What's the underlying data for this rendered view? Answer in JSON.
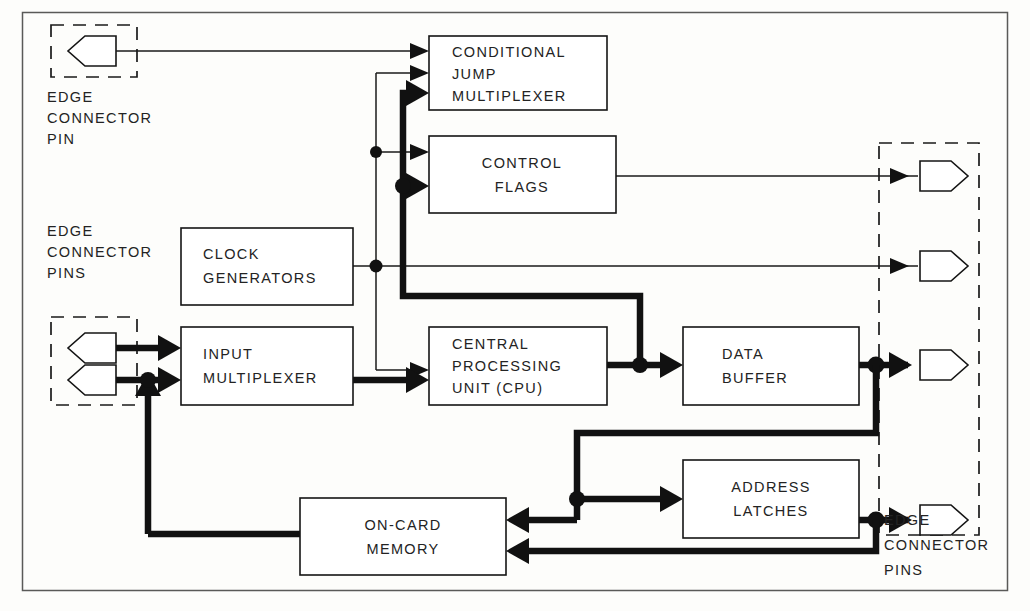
{
  "diagram": {
    "type": "block-diagram",
    "colors": {
      "line": "#111111",
      "block_border": "#141414",
      "text": "#232323",
      "frame": "#5a5a58",
      "background": "#fdfdfb"
    },
    "blocks": [
      {
        "id": "conditional-jump-multiplexer",
        "lines": [
          "CONDITIONAL",
          "JUMP",
          "MULTIPLEXER"
        ],
        "align": "left",
        "x": 429,
        "y": 36,
        "w": 178,
        "h": 74
      },
      {
        "id": "control-flags",
        "lines": [
          "CONTROL",
          "FLAGS"
        ],
        "align": "center",
        "x": 429,
        "y": 136,
        "w": 187,
        "h": 77
      },
      {
        "id": "clock-generators",
        "lines": [
          "CLOCK",
          "GENERATORS"
        ],
        "align": "left",
        "x": 181,
        "y": 228,
        "w": 172,
        "h": 77
      },
      {
        "id": "input-multiplexer",
        "lines": [
          "INPUT",
          "MULTIPLEXER"
        ],
        "align": "left",
        "x": 181,
        "y": 327,
        "w": 172,
        "h": 78
      },
      {
        "id": "central-processing-unit",
        "lines": [
          "CENTRAL",
          "PROCESSING",
          "UNIT  (CPU)"
        ],
        "align": "left",
        "x": 429,
        "y": 327,
        "w": 178,
        "h": 78
      },
      {
        "id": "data-buffer",
        "lines": [
          "DATA",
          "BUFFER"
        ],
        "align": "left",
        "x": 683,
        "y": 327,
        "w": 176,
        "h": 78
      },
      {
        "id": "address-latches",
        "lines": [
          "ADDRESS",
          "LATCHES"
        ],
        "align": "center",
        "x": 683,
        "y": 460,
        "w": 176,
        "h": 78
      },
      {
        "id": "on-card-memory",
        "lines": [
          "ON-CARD",
          "MEMORY"
        ],
        "align": "center",
        "x": 300,
        "y": 498,
        "w": 206,
        "h": 77
      }
    ],
    "annotations": [
      {
        "id": "edge-connector-pin-top",
        "lines": [
          "EDGE",
          "CONNECTOR",
          "PIN"
        ],
        "x": 47,
        "y": 98
      },
      {
        "id": "edge-connector-pins-left",
        "lines": [
          "EDGE",
          "CONNECTOR",
          "PINS"
        ],
        "x": 47,
        "y": 232
      },
      {
        "id": "edge-connector-pins-right",
        "lines": [
          "EDGE",
          "CONNECTOR",
          "PINS"
        ],
        "x": 884,
        "y": 521
      }
    ],
    "connector_groups": [
      {
        "id": "edge-connector-group-top",
        "x": 51,
        "y": 25,
        "w": 86,
        "h": 52,
        "pins": 1,
        "direction": "left"
      },
      {
        "id": "edge-connector-group-left",
        "x": 51,
        "y": 317,
        "w": 86,
        "h": 88,
        "pins": 2,
        "direction": "left"
      },
      {
        "id": "edge-connector-group-right",
        "x": 879,
        "y": 143,
        "w": 100,
        "h": 392,
        "pins": 4,
        "direction": "right"
      }
    ],
    "signals": [
      {
        "from": "edge-connector-pin-top",
        "to": "conditional-jump-multiplexer",
        "weight": "thin"
      },
      {
        "from": "clock-generators",
        "to": "conditional-jump-multiplexer",
        "weight": "thin"
      },
      {
        "from": "clock-generators",
        "to": "control-flags",
        "weight": "thin"
      },
      {
        "from": "clock-generators",
        "to": "central-processing-unit",
        "weight": "thin"
      },
      {
        "from": "clock-generators",
        "to": "edge-connector-group-right",
        "weight": "thin"
      },
      {
        "from": "central-processing-unit",
        "to": "conditional-jump-multiplexer",
        "weight": "bus"
      },
      {
        "from": "central-processing-unit",
        "to": "control-flags",
        "weight": "bus"
      },
      {
        "from": "control-flags",
        "to": "edge-connector-group-right",
        "weight": "thin"
      },
      {
        "from": "edge-connector-group-left",
        "to": "input-multiplexer",
        "weight": "bus"
      },
      {
        "from": "input-multiplexer",
        "to": "central-processing-unit",
        "weight": "bus"
      },
      {
        "from": "central-processing-unit",
        "to": "data-buffer",
        "weight": "bus"
      },
      {
        "from": "data-buffer",
        "to": "edge-connector-group-right",
        "weight": "bus"
      },
      {
        "from": "data-buffer",
        "to": "address-latches",
        "weight": "bus"
      },
      {
        "from": "data-buffer",
        "to": "on-card-memory",
        "weight": "bus"
      },
      {
        "from": "address-latches",
        "to": "edge-connector-group-right",
        "weight": "bus"
      },
      {
        "from": "address-latches",
        "to": "on-card-memory",
        "weight": "bus"
      },
      {
        "from": "on-card-memory",
        "to": "input-multiplexer",
        "weight": "bus"
      }
    ]
  }
}
